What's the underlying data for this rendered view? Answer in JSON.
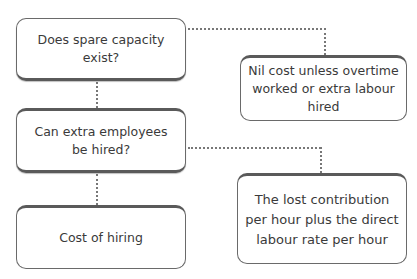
{
  "diagram": {
    "nodes": [
      {
        "id": "q1",
        "text": "Does spare capacity\nexist?"
      },
      {
        "id": "q2",
        "text": "Can extra employees\nbe hired?"
      },
      {
        "id": "r3",
        "text": "Cost of hiring"
      },
      {
        "id": "r1",
        "text": "Nil cost unless overtime\nworked or extra labour\nhired"
      },
      {
        "id": "r2",
        "text": "The lost contribution\nper hour plus the direct\nlabour rate per hour"
      }
    ],
    "edges": [
      {
        "from": "q1",
        "to": "r1",
        "style": "dotted"
      },
      {
        "from": "q1",
        "to": "q2",
        "style": "dotted"
      },
      {
        "from": "q2",
        "to": "r2",
        "style": "dotted"
      },
      {
        "from": "q2",
        "to": "r3",
        "style": "dotted"
      }
    ]
  }
}
